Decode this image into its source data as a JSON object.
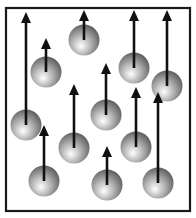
{
  "diagram": {
    "box": {
      "x": 6,
      "y": 8,
      "width": 184,
      "height": 203,
      "stroke": "#1a1a1a",
      "stroke_width": 2.2
    },
    "colors": {
      "arrow": "#111111",
      "ball_light": "#ffffff",
      "ball_mid": "#b8b8b8",
      "ball_dark": "#5a5a5a",
      "background": "#ffffff"
    },
    "ball_radius": 15.5,
    "particles": [
      {
        "id": "A",
        "cx": 26,
        "cy": 125,
        "arrow_tip_y": 12
      },
      {
        "id": "B",
        "cx": 46,
        "cy": 72,
        "arrow_tip_y": 38
      },
      {
        "id": "C",
        "cx": 84,
        "cy": 40,
        "arrow_tip_y": 10
      },
      {
        "id": "D",
        "cx": 134,
        "cy": 68,
        "arrow_tip_y": 10
      },
      {
        "id": "E",
        "cx": 167,
        "cy": 86,
        "arrow_tip_y": 10
      },
      {
        "id": "F",
        "cx": 74,
        "cy": 148,
        "arrow_tip_y": 84
      },
      {
        "id": "G",
        "cx": 106,
        "cy": 115,
        "arrow_tip_y": 63
      },
      {
        "id": "H",
        "cx": 136,
        "cy": 147,
        "arrow_tip_y": 87
      },
      {
        "id": "I",
        "cx": 44,
        "cy": 181,
        "arrow_tip_y": 125
      },
      {
        "id": "J",
        "cx": 107,
        "cy": 185,
        "arrow_tip_y": 146
      },
      {
        "id": "K",
        "cx": 158,
        "cy": 183,
        "arrow_tip_y": 92
      }
    ]
  }
}
